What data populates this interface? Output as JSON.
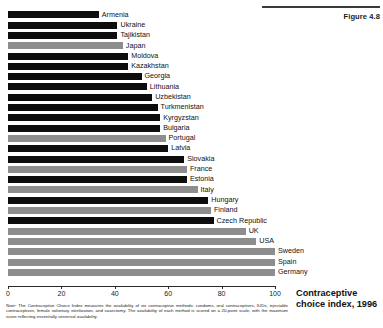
{
  "figure": {
    "number_label": "Figure 4.8",
    "caption": "Contraceptive choice index, 1996"
  },
  "note": {
    "prefix": "Note:",
    "text": " The Contraceptive Choice Index measures the availability of six contraceptive methods: condoms, oral contraceptives, IUDs, injectable contraceptives, female voluntary sterilization, and vasectomy. The availability of each method is scored on a 20-point scale, with the maximum score reflecting essentially universal availability."
  },
  "axis": {
    "ticks": [
      0,
      20,
      40,
      60,
      80,
      100
    ],
    "tick_labels": [
      "0",
      "20",
      "40",
      "60",
      "80",
      "100"
    ],
    "min": 0,
    "max": 100
  },
  "colors": {
    "bar_dark": "#0d0d0d",
    "bar_light": "#8d8d8d",
    "axis": "#2b2b2b",
    "text": "#111111"
  },
  "chart_data": {
    "type": "bar",
    "orientation": "horizontal",
    "title": "Contraceptive choice index, 1996",
    "xlabel": "",
    "ylabel": "",
    "xlim": [
      0,
      100
    ],
    "grid": false,
    "legend": "none",
    "categories": [
      "Armenia",
      "Ukraine",
      "Tajikistan",
      "Japan",
      "Moldova",
      "Kazakhstan",
      "Georgia",
      "Lithuania",
      "Uzbekistan",
      "Turkmenistan",
      "Kyrgyzstan",
      "Bulgaria",
      "Portugal",
      "Latvia",
      "Slovakia",
      "France",
      "Estonia",
      "Italy",
      "Hungary",
      "Finland",
      "Czech Republic",
      "UK",
      "USA",
      "Sweden",
      "Spain",
      "Germany"
    ],
    "values": [
      34,
      41,
      41,
      43,
      45,
      45,
      50,
      52,
      54,
      56,
      57,
      57,
      59,
      60,
      66,
      67,
      67,
      71,
      75,
      76,
      77,
      89,
      93,
      100,
      100,
      100
    ],
    "bar_shades": [
      "dark",
      "dark",
      "dark",
      "light",
      "dark",
      "dark",
      "dark",
      "dark",
      "dark",
      "dark",
      "dark",
      "dark",
      "light",
      "dark",
      "dark",
      "light",
      "dark",
      "light",
      "dark",
      "light",
      "dark",
      "light",
      "light",
      "light",
      "light",
      "light"
    ],
    "bars": [
      {
        "label": "Armenia",
        "value": 34,
        "shade": "dark"
      },
      {
        "label": "Ukraine",
        "value": 41,
        "shade": "dark"
      },
      {
        "label": "Tajikistan",
        "value": 41,
        "shade": "dark"
      },
      {
        "label": "Japan",
        "value": 43,
        "shade": "light"
      },
      {
        "label": "Moldova",
        "value": 45,
        "shade": "dark"
      },
      {
        "label": "Kazakhstan",
        "value": 45,
        "shade": "dark"
      },
      {
        "label": "Georgia",
        "value": 50,
        "shade": "dark"
      },
      {
        "label": "Lithuania",
        "value": 52,
        "shade": "dark"
      },
      {
        "label": "Uzbekistan",
        "value": 54,
        "shade": "dark"
      },
      {
        "label": "Turkmenistan",
        "value": 56,
        "shade": "dark"
      },
      {
        "label": "Kyrgyzstan",
        "value": 57,
        "shade": "dark"
      },
      {
        "label": "Bulgaria",
        "value": 57,
        "shade": "dark"
      },
      {
        "label": "Portugal",
        "value": 59,
        "shade": "light"
      },
      {
        "label": "Latvia",
        "value": 60,
        "shade": "dark"
      },
      {
        "label": "Slovakia",
        "value": 66,
        "shade": "dark"
      },
      {
        "label": "France",
        "value": 67,
        "shade": "light"
      },
      {
        "label": "Estonia",
        "value": 67,
        "shade": "dark"
      },
      {
        "label": "Italy",
        "value": 71,
        "shade": "light"
      },
      {
        "label": "Hungary",
        "value": 75,
        "shade": "dark"
      },
      {
        "label": "Finland",
        "value": 76,
        "shade": "light"
      },
      {
        "label": "Czech Republic",
        "value": 77,
        "shade": "dark"
      },
      {
        "label": "UK",
        "value": 89,
        "shade": "light"
      },
      {
        "label": "USA",
        "value": 93,
        "shade": "light"
      },
      {
        "label": "Sweden",
        "value": 100,
        "shade": "light"
      },
      {
        "label": "Spain",
        "value": 100,
        "shade": "light"
      },
      {
        "label": "Germany",
        "value": 100,
        "shade": "light"
      }
    ]
  }
}
